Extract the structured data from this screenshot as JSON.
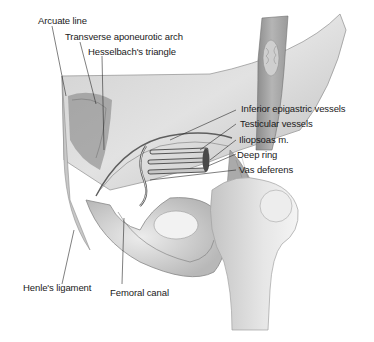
{
  "figure": {
    "colors": {
      "background": "#ffffff",
      "ink": "#1a1a1a",
      "shade_dark": "#6e6e6e",
      "shade_mid": "#a8a8a8",
      "shade_light": "#d6d6d6"
    },
    "labels": {
      "arcuate_line": "Arcuate line",
      "transverse_aponeurotic_arch": "Transverse aponeurotic arch",
      "hesselbachs_triangle": "Hesselbach's triangle",
      "inferior_epigastric_vessels": "Inferior epigastric vessels",
      "testicular_vessels": "Testicular vessels",
      "iliopsoas": "Iliopsoas m.",
      "deep_ring": "Deep ring",
      "vas_deferens": "Vas deferens",
      "henles_ligament": "Henle's ligament",
      "femoral_canal": "Femoral canal"
    }
  }
}
